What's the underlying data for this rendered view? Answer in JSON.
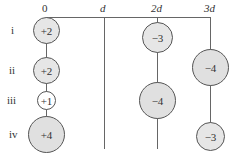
{
  "axis": {
    "labels": [
      {
        "text": "0",
        "italic": false,
        "x": 46
      },
      {
        "text": "d",
        "italic": true,
        "x": 104
      },
      {
        "text": "2d",
        "italic": true,
        "x": 157
      },
      {
        "text": "3d",
        "italic": true,
        "x": 210
      }
    ]
  },
  "rows": [
    {
      "label": "i",
      "y": 30
    },
    {
      "label": "ii",
      "y": 70
    },
    {
      "label": "iii",
      "y": 100
    },
    {
      "label": "iv",
      "y": 134
    }
  ],
  "charges": [
    {
      "row": "i",
      "position": "0",
      "value": "+2",
      "x": 46,
      "y": 30,
      "r": 13,
      "fill": "#e6e6e6"
    },
    {
      "row": "ii",
      "position": "0",
      "value": "+2",
      "x": 46,
      "y": 70,
      "r": 13,
      "fill": "#e6e6e6"
    },
    {
      "row": "iii",
      "position": "0",
      "value": "+1",
      "x": 46,
      "y": 100,
      "r": 9,
      "fill": "#ffffff"
    },
    {
      "row": "iv",
      "position": "0",
      "value": "+4",
      "x": 46,
      "y": 134,
      "r": 18,
      "fill": "#e0e0e0"
    },
    {
      "row": "i",
      "position": "2d",
      "value": "−3",
      "x": 157,
      "y": 37,
      "r": 15,
      "fill": "#e6e6e6"
    },
    {
      "row": "ii",
      "position": "3d",
      "value": "−4",
      "x": 210,
      "y": 67,
      "r": 18,
      "fill": "#e0e0e0"
    },
    {
      "row": "iii",
      "position": "2d",
      "value": "−4",
      "x": 157,
      "y": 100,
      "r": 18,
      "fill": "#e0e0e0"
    },
    {
      "row": "iv",
      "position": "3d",
      "value": "−3",
      "x": 210,
      "y": 136,
      "r": 14,
      "fill": "#e6e6e6"
    }
  ]
}
